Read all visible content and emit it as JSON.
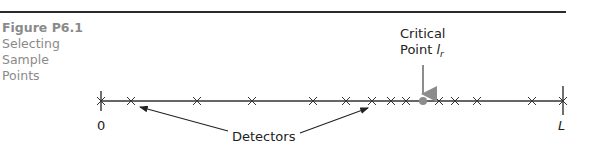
{
  "figure": {
    "number": "Figure P6.1",
    "title_lines": [
      "Selecting",
      "Sample",
      "Points"
    ]
  },
  "diagram": {
    "critical_label_line1": "Critical",
    "critical_label_line2": "Point",
    "critical_symbol": "l",
    "critical_subscript": "r",
    "detectors_label": "Detectors",
    "start_label": "0",
    "end_label": "L",
    "line_color": "#333333",
    "critical_color": "#8c8c8c",
    "detector_x_positions": [
      131,
      197,
      252,
      313,
      346,
      372,
      391,
      406,
      439,
      455,
      477,
      532
    ],
    "critical_x": 423,
    "start_x": 101,
    "end_x": 563
  }
}
